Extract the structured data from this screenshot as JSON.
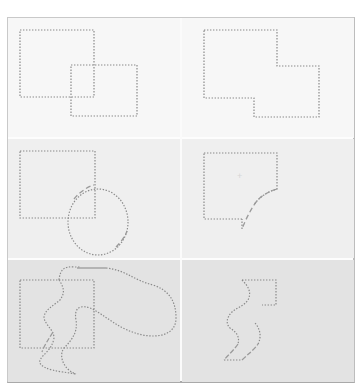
{
  "figure": {
    "colors": {
      "frame_border": "#c9c9c9",
      "row1_bg": "#f7f7f7",
      "row2_bg": "#efefef",
      "row3_bg": "#e3e3e3",
      "marquee_stroke": "#8a8a8a"
    },
    "rows": [
      {
        "name": "rectangle-rectangle",
        "left": {
          "label": "",
          "shapes": [
            "rectangle",
            "rectangle"
          ]
        },
        "right": {
          "label": "",
          "shapes": [
            "union-polygon"
          ]
        }
      },
      {
        "name": "rectangle-ellipse",
        "left": {
          "label": "",
          "shapes": [
            "rectangle",
            "ellipse"
          ]
        },
        "right": {
          "label": "",
          "shapes": [
            "rectangle-minus-ellipse"
          ]
        }
      },
      {
        "name": "rectangle-lasso",
        "left": {
          "label": "",
          "shapes": [
            "rectangle",
            "freeform-lasso"
          ]
        },
        "right": {
          "label": "",
          "shapes": [
            "rectangle-intersect-lasso"
          ]
        }
      }
    ]
  }
}
